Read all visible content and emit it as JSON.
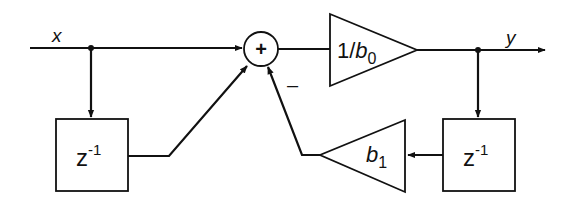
{
  "diagram": {
    "type": "block-diagram",
    "input_label": "x",
    "output_label": "y",
    "summer": {
      "symbol": "+",
      "negative_sign": "–"
    },
    "forward_gain": {
      "prefix": "1/",
      "var": "b",
      "sub": "0"
    },
    "feedback_gain": {
      "var": "b",
      "sub": "1"
    },
    "delay_left": {
      "base": "z",
      "exp": "-1"
    },
    "delay_right": {
      "base": "z",
      "exp": "-1"
    }
  }
}
